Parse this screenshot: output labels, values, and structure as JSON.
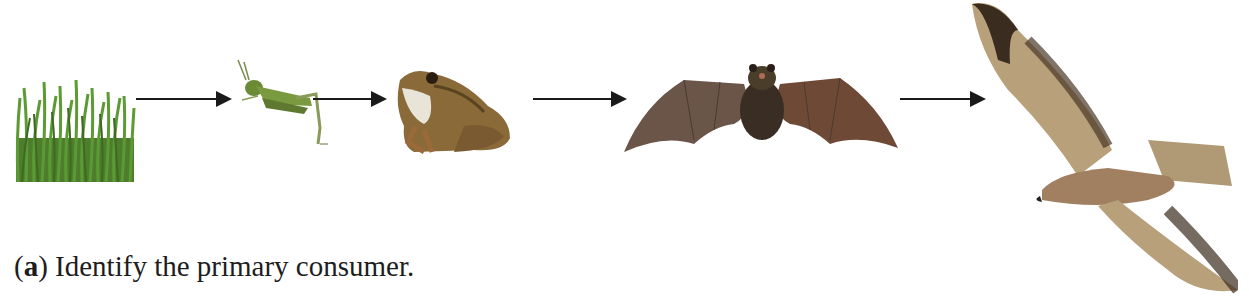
{
  "figure": {
    "food_chain": [
      {
        "name": "grass",
        "role": "producer"
      },
      {
        "name": "grasshopper",
        "role": "primary consumer"
      },
      {
        "name": "frog",
        "role": "secondary consumer"
      },
      {
        "name": "bat",
        "role": "tertiary consumer"
      },
      {
        "name": "hawk",
        "role": "quaternary consumer"
      }
    ],
    "arrows": 4,
    "colors": {
      "arrow": "#1a1a1a",
      "grass": "#5a8a35",
      "grasshopper": "#6f8a3a",
      "frog": "#8a6a3a",
      "bat": "#5a4538",
      "hawk": "#b9a27a"
    }
  },
  "questions": [
    {
      "label": "(a)",
      "label_letter": "a",
      "text": "Identify the primary consumer."
    }
  ]
}
